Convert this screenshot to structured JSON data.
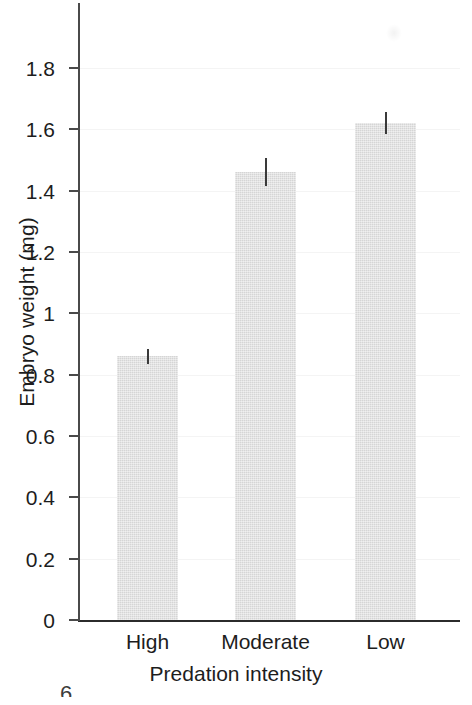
{
  "chart_data": {
    "type": "bar",
    "title": "",
    "subtitle": "",
    "xlabel": "Predation intensity",
    "ylabel": "Embryo weight (mg)",
    "categories": [
      "High",
      "Moderate",
      "Low"
    ],
    "values": [
      0.86,
      1.46,
      1.62
    ],
    "errors": [
      0.025,
      0.045,
      0.035
    ],
    "error_type": "standard error bars",
    "ylim": [
      0,
      1.94
    ],
    "yticks": [
      0,
      0.2,
      0.4,
      0.6,
      0.8,
      1,
      1.2,
      1.4,
      1.6,
      1.8
    ],
    "ytick_labels": [
      "0",
      "0.2",
      "0.4",
      "0.6",
      "0.8",
      "1",
      "1.2",
      "1.4",
      "1.6",
      "1.8"
    ],
    "grid": "faint horizontal gridlines",
    "legend": "none",
    "bar_color": "#dddddd",
    "axis_color": "#2b2b2b",
    "error_bar_color": "#3a3a3a",
    "series": [
      {
        "name": "Embryo weight",
        "values": [
          0.86,
          1.46,
          1.62
        ],
        "errors": [
          0.025,
          0.045,
          0.035
        ]
      }
    ]
  },
  "figure": {
    "corner_mark": "6"
  }
}
